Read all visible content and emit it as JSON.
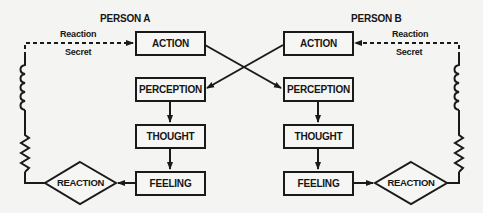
{
  "diagram": {
    "person_a": {
      "title": "PERSON A",
      "reaction_label": "Reaction",
      "secret_label": "Secret",
      "boxes": [
        "ACTION",
        "PERCEPTION",
        "THOUGHT",
        "FEELING"
      ],
      "diamond": "REACTION"
    },
    "person_b": {
      "title": "PERSON B",
      "reaction_label": "Reaction",
      "secret_label": "Secret",
      "boxes": [
        "ACTION",
        "PERCEPTION",
        "THOUGHT",
        "FEELING"
      ],
      "diamond": "REACTION"
    },
    "edges": [
      {
        "from": "A.ACTION",
        "to": "B.PERCEPTION",
        "style": "solid-arrow"
      },
      {
        "from": "B.ACTION",
        "to": "A.PERCEPTION",
        "style": "solid-arrow"
      },
      {
        "from": "A.PERCEPTION",
        "to": "A.THOUGHT",
        "style": "solid-arrow"
      },
      {
        "from": "A.THOUGHT",
        "to": "A.FEELING",
        "style": "solid-arrow"
      },
      {
        "from": "A.FEELING",
        "to": "A.REACTION",
        "style": "solid-arrow"
      },
      {
        "from": "A.REACTION",
        "to": "A.ACTION",
        "style": "coil-zigzag-then-dashed-arrow"
      },
      {
        "from": "B.PERCEPTION",
        "to": "B.THOUGHT",
        "style": "solid-arrow"
      },
      {
        "from": "B.THOUGHT",
        "to": "B.FEELING",
        "style": "solid-arrow"
      },
      {
        "from": "B.FEELING",
        "to": "B.REACTION",
        "style": "solid-arrow"
      },
      {
        "from": "B.REACTION",
        "to": "B.ACTION",
        "style": "coil-zigzag-then-dashed-arrow"
      }
    ]
  }
}
